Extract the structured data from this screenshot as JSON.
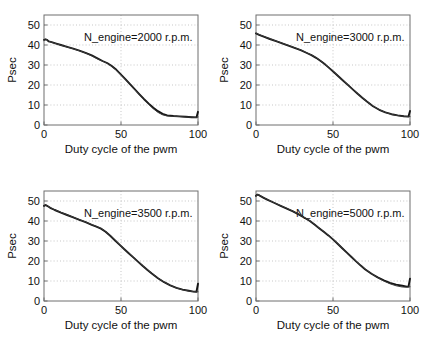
{
  "figure": {
    "title": "",
    "layout": "2x2 subplot grid",
    "background": "#ffffff",
    "line_colors": [
      "#141414",
      "#3a3a3a"
    ]
  },
  "chart_data": [
    {
      "type": "line",
      "panel": "top-left",
      "title": "",
      "annotation": "N_engine=2000 r.p.m.",
      "xlabel": "Duty cycle of the pwm",
      "ylabel": "Psec",
      "xlim": [
        0,
        100
      ],
      "ylim": [
        0,
        55
      ],
      "xticks": [
        0,
        50,
        100
      ],
      "xticklabels": [
        "0",
        "50",
        "100"
      ],
      "yticks": [
        0,
        10,
        20,
        30,
        40,
        50
      ],
      "yticklabels": [
        "0",
        "10",
        "20",
        "30",
        "40",
        "50"
      ],
      "grid": true,
      "legend": null,
      "series": [
        {
          "name": "measured",
          "x": [
            0,
            1,
            2,
            3,
            5,
            8,
            11,
            15,
            19,
            23,
            27,
            31,
            35,
            38,
            41,
            44,
            47,
            50,
            53,
            56,
            59,
            62,
            65,
            68,
            71,
            74,
            77,
            80,
            84,
            88,
            92,
            96,
            99,
            100
          ],
          "values": [
            42.6,
            42.8,
            42.6,
            41.8,
            41.4,
            40.7,
            40.0,
            39.1,
            38.2,
            37.2,
            36.1,
            34.8,
            33.2,
            32.0,
            31.0,
            29.5,
            27.6,
            25.2,
            22.8,
            20.3,
            17.8,
            15.3,
            12.9,
            10.7,
            8.6,
            6.9,
            5.6,
            4.8,
            4.5,
            4.3,
            4.1,
            3.9,
            3.8,
            6.6
          ]
        },
        {
          "name": "model",
          "x": [
            0,
            1,
            2,
            3,
            5,
            8,
            11,
            15,
            19,
            23,
            27,
            31,
            35,
            38,
            41,
            44,
            47,
            50,
            53,
            56,
            59,
            62,
            65,
            68,
            71,
            74,
            77,
            80,
            84,
            88,
            92,
            96,
            99,
            100
          ],
          "values": [
            42.3,
            42.9,
            42.7,
            42.0,
            41.3,
            40.6,
            39.9,
            39.0,
            38.1,
            37.1,
            36.0,
            34.6,
            33.0,
            31.9,
            30.8,
            29.3,
            27.4,
            25.0,
            22.6,
            20.1,
            17.6,
            15.1,
            12.6,
            10.3,
            8.1,
            6.3,
            5.1,
            4.5,
            4.3,
            4.2,
            4.0,
            3.9,
            3.8,
            4.0
          ]
        }
      ]
    },
    {
      "type": "line",
      "panel": "top-right",
      "title": "",
      "annotation": "N_engine=3000 r.p.m.",
      "xlabel": "Duty cycle of the pwm",
      "ylabel": "Psec",
      "xlim": [
        0,
        100
      ],
      "ylim": [
        0,
        55
      ],
      "xticks": [
        0,
        50,
        100
      ],
      "xticklabels": [
        "0",
        "50",
        "100"
      ],
      "yticks": [
        0,
        10,
        20,
        30,
        40,
        50
      ],
      "yticklabels": [
        "0",
        "10",
        "20",
        "30",
        "40",
        "50"
      ],
      "grid": true,
      "legend": null,
      "series": [
        {
          "name": "measured",
          "x": [
            0,
            2,
            5,
            9,
            13,
            17,
            21,
            25,
            29,
            33,
            36,
            39,
            42,
            45,
            48,
            51,
            54,
            57,
            60,
            63,
            66,
            69,
            72,
            76,
            80,
            84,
            88,
            92,
            96,
            99,
            100
          ],
          "values": [
            45.8,
            45.1,
            44.2,
            43.0,
            41.9,
            40.8,
            39.7,
            38.6,
            37.4,
            36.0,
            34.9,
            33.6,
            32.0,
            30.2,
            28.2,
            26.1,
            24.0,
            21.9,
            19.8,
            17.7,
            15.6,
            13.6,
            11.7,
            9.4,
            7.6,
            6.3,
            5.4,
            4.8,
            4.4,
            4.2,
            7.0
          ]
        },
        {
          "name": "model",
          "x": [
            0,
            2,
            5,
            9,
            13,
            17,
            21,
            25,
            29,
            33,
            36,
            39,
            42,
            45,
            48,
            51,
            54,
            57,
            60,
            63,
            66,
            69,
            72,
            76,
            80,
            84,
            88,
            92,
            96,
            99,
            100
          ],
          "values": [
            45.9,
            45.2,
            44.3,
            43.1,
            42.0,
            40.9,
            39.8,
            38.7,
            37.5,
            36.1,
            35.0,
            33.7,
            32.1,
            30.3,
            28.3,
            26.2,
            24.1,
            22.0,
            19.9,
            17.8,
            15.7,
            13.7,
            11.8,
            9.5,
            7.7,
            6.3,
            5.3,
            4.7,
            4.3,
            4.2,
            4.2
          ]
        }
      ]
    },
    {
      "type": "line",
      "panel": "bottom-left",
      "title": "",
      "annotation": "N_engine=3500 r.p.m.",
      "xlabel": "Duty cycle of the pwm",
      "ylabel": "Psec",
      "xlim": [
        0,
        100
      ],
      "ylim": [
        0,
        55
      ],
      "xticks": [
        0,
        50,
        100
      ],
      "xticklabels": [
        "0",
        "50",
        "100"
      ],
      "yticks": [
        0,
        10,
        20,
        30,
        40,
        50
      ],
      "yticklabels": [
        "0",
        "10",
        "20",
        "30",
        "40",
        "50"
      ],
      "grid": true,
      "legend": null,
      "series": [
        {
          "name": "measured",
          "x": [
            0,
            1,
            2,
            4,
            7,
            11,
            15,
            19,
            23,
            27,
            31,
            34,
            37,
            40,
            43,
            46,
            49,
            52,
            55,
            58,
            61,
            64,
            67,
            70,
            74,
            78,
            82,
            86,
            90,
            94,
            97,
            99,
            100
          ],
          "values": [
            47.6,
            48.0,
            47.6,
            46.6,
            45.5,
            44.2,
            43.0,
            41.8,
            40.6,
            39.4,
            38.1,
            37.2,
            36.2,
            34.6,
            32.6,
            30.4,
            28.2,
            26.0,
            23.9,
            21.8,
            19.7,
            17.6,
            15.6,
            13.7,
            11.4,
            9.4,
            7.8,
            6.6,
            5.7,
            5.1,
            4.7,
            4.6,
            8.6
          ]
        },
        {
          "name": "model",
          "x": [
            0,
            1,
            2,
            4,
            7,
            11,
            15,
            19,
            23,
            27,
            31,
            34,
            37,
            40,
            43,
            46,
            49,
            52,
            55,
            58,
            61,
            64,
            67,
            70,
            74,
            78,
            82,
            86,
            90,
            94,
            97,
            99,
            100
          ],
          "values": [
            47.3,
            48.1,
            47.7,
            46.7,
            45.6,
            44.3,
            43.1,
            41.9,
            40.7,
            39.5,
            38.2,
            37.3,
            36.3,
            34.7,
            32.7,
            30.5,
            28.3,
            26.1,
            24.0,
            21.9,
            19.8,
            17.7,
            15.7,
            13.8,
            11.5,
            9.5,
            7.8,
            6.5,
            5.6,
            5.0,
            4.7,
            4.6,
            4.6
          ]
        }
      ]
    },
    {
      "type": "line",
      "panel": "bottom-right",
      "title": "",
      "annotation": "N_engine=5000 r.p.m.",
      "xlabel": "Duty cycle of the pwm",
      "ylabel": "Psec",
      "xlim": [
        0,
        100
      ],
      "ylim": [
        0,
        55
      ],
      "xticks": [
        0,
        50,
        100
      ],
      "xticklabels": [
        "0",
        "50",
        "100"
      ],
      "yticks": [
        0,
        10,
        20,
        30,
        40,
        50
      ],
      "yticklabels": [
        "0",
        "10",
        "20",
        "30",
        "40",
        "50"
      ],
      "grid": true,
      "legend": null,
      "series": [
        {
          "name": "measured",
          "x": [
            0,
            1,
            2,
            3,
            5,
            8,
            12,
            16,
            20,
            24,
            28,
            32,
            35,
            38,
            41,
            44,
            47,
            50,
            53,
            56,
            59,
            62,
            65,
            68,
            71,
            75,
            79,
            83,
            87,
            91,
            95,
            98,
            99,
            100
          ],
          "values": [
            52.6,
            53.2,
            52.9,
            52.4,
            51.6,
            50.4,
            49.0,
            47.6,
            46.2,
            44.8,
            43.2,
            41.4,
            40.0,
            38.2,
            36.4,
            34.6,
            32.8,
            30.8,
            28.6,
            26.4,
            24.2,
            22.0,
            19.8,
            17.7,
            15.8,
            13.6,
            11.8,
            10.3,
            9.1,
            8.2,
            7.6,
            7.2,
            7.2,
            11.2
          ]
        },
        {
          "name": "model",
          "x": [
            0,
            1,
            2,
            3,
            5,
            8,
            12,
            16,
            20,
            24,
            28,
            32,
            35,
            38,
            41,
            44,
            47,
            50,
            53,
            56,
            59,
            62,
            65,
            68,
            71,
            75,
            79,
            83,
            87,
            91,
            95,
            98,
            99,
            100
          ],
          "values": [
            52.4,
            53.3,
            53.0,
            52.5,
            51.7,
            50.5,
            49.1,
            47.7,
            46.3,
            44.9,
            43.3,
            41.5,
            40.1,
            38.3,
            36.5,
            34.7,
            32.9,
            30.9,
            28.7,
            26.5,
            24.3,
            22.1,
            19.9,
            17.8,
            15.9,
            13.7,
            11.7,
            10.0,
            8.6,
            7.6,
            7.0,
            6.9,
            7.0,
            7.1
          ]
        }
      ]
    }
  ]
}
